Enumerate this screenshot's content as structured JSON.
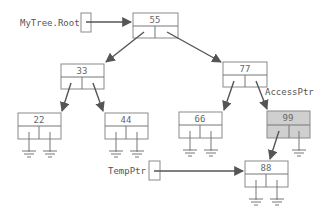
{
  "diagram": {
    "type": "binary-search-tree-pointers",
    "colors": {
      "node_border": "#8a8a8a",
      "highlight_fill": "#cfcfcf",
      "arrow": "#555555",
      "text": "#555555"
    },
    "pointers": {
      "root": {
        "label": "MyTree.Root",
        "target": "55"
      },
      "temp": {
        "label": "TempPtr",
        "target": "88"
      },
      "access": {
        "label": "AccessPtr",
        "target": "99"
      }
    },
    "nodes": {
      "n55": {
        "value": "55",
        "left": "33",
        "right": "77",
        "highlighted": false
      },
      "n33": {
        "value": "33",
        "left": "22",
        "right": "44",
        "highlighted": false
      },
      "n77": {
        "value": "77",
        "left": "66",
        "right": "99",
        "highlighted": false
      },
      "n22": {
        "value": "22",
        "left": null,
        "right": null,
        "highlighted": false
      },
      "n44": {
        "value": "44",
        "left": null,
        "right": null,
        "highlighted": false
      },
      "n66": {
        "value": "66",
        "left": null,
        "right": null,
        "highlighted": false
      },
      "n99": {
        "value": "99",
        "left": "88",
        "right": null,
        "highlighted": true
      },
      "n88": {
        "value": "88",
        "left": null,
        "right": null,
        "highlighted": false
      }
    }
  }
}
